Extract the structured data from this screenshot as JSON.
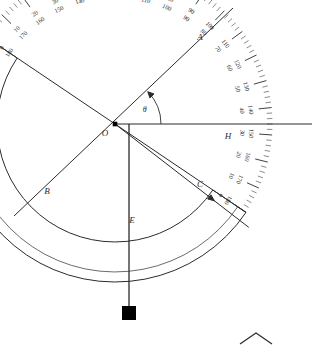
{
  "figure": {
    "type": "clinometer-protractor-diagram",
    "background_color": "#ffffff",
    "ink_color": "#2b2b2b"
  },
  "geometry": {
    "center": {
      "x": 115,
      "y": 124,
      "label": "O"
    },
    "outer_radius": 148,
    "inner_radius": 118,
    "body_radius": 158,
    "tilt_degrees": -34,
    "straight_edge": {
      "from_x": 14,
      "from_y": 216,
      "to_x": 233,
      "to_y": 8
    },
    "plumb_line": {
      "x": 129,
      "from_y": 124,
      "to_y": 306
    },
    "horizontal_ray": {
      "y": 124,
      "from_x": 115,
      "to_x": 312
    }
  },
  "points": [
    {
      "name": "O",
      "label": "O",
      "x": 115,
      "y": 124,
      "role": "protractor-center"
    },
    {
      "name": "A",
      "label": "A",
      "x": 206,
      "y": 45,
      "role": "inner-arc-zero-end"
    },
    {
      "name": "B",
      "label": "B",
      "x": 45,
      "y": 198,
      "role": "inner-arc-180-end"
    },
    {
      "name": "C",
      "label": "C",
      "x": 203,
      "y": 192,
      "role": "sight-line-arc-crossing"
    },
    {
      "name": "E",
      "label": "E",
      "x": 129,
      "y": 227,
      "role": "plumb-line-arc-crossing"
    },
    {
      "name": "H",
      "label": "H",
      "x": 231,
      "y": 128,
      "role": "horizontal-ray-arc-crossing"
    }
  ],
  "angle_marker": {
    "label": "θ",
    "at": "O",
    "between": [
      "horizontal ray OH",
      "straight edge toward A"
    ],
    "arc_radius": 46
  },
  "plumb_bob": {
    "shape": "square-weight",
    "x": 129,
    "y": 313,
    "size": 13,
    "color": "#000000"
  },
  "scale": {
    "description": "dual protractor scale, outer 0-180 clockwise, inner 180-0",
    "major_step_degrees": 10,
    "minor_step_degrees": 2,
    "labels": [
      {
        "deg": 0,
        "outer": "0",
        "inner": "180"
      },
      {
        "deg": 10,
        "outer": "10",
        "inner": "170"
      },
      {
        "deg": 20,
        "outer": "20",
        "inner": "160"
      },
      {
        "deg": 30,
        "outer": "30",
        "inner": "150"
      },
      {
        "deg": 40,
        "outer": "40",
        "inner": "140"
      },
      {
        "deg": 50,
        "outer": "50",
        "inner": "130"
      },
      {
        "deg": 60,
        "outer": "60",
        "inner": "120"
      },
      {
        "deg": 70,
        "outer": "70",
        "inner": "110"
      },
      {
        "deg": 80,
        "outer": "80",
        "inner": "100"
      },
      {
        "deg": 90,
        "outer": "90",
        "inner": "90"
      },
      {
        "deg": 100,
        "outer": "100",
        "inner": "80"
      },
      {
        "deg": 110,
        "outer": "110",
        "inner": "70"
      },
      {
        "deg": 120,
        "outer": "120",
        "inner": "60"
      },
      {
        "deg": 130,
        "outer": "130",
        "inner": "50"
      },
      {
        "deg": 140,
        "outer": "140",
        "inner": "40"
      },
      {
        "deg": 150,
        "outer": "150",
        "inner": "30"
      },
      {
        "deg": 160,
        "outer": "160",
        "inner": "20"
      },
      {
        "deg": 170,
        "outer": "170",
        "inner": "10"
      },
      {
        "deg": 180,
        "outer": "180",
        "inner": "0"
      }
    ]
  },
  "corner_mark": {
    "shape": "chevron-apex",
    "x": 256,
    "y": 333
  }
}
